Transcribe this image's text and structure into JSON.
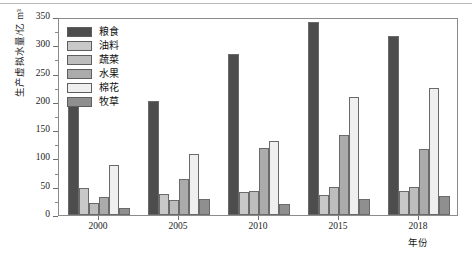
{
  "chart_data": {
    "type": "bar",
    "title": "",
    "xlabel": "年份",
    "ylabel": "生产虚拟水量/亿 m³",
    "categories": [
      "2000",
      "2005",
      "2010",
      "2015",
      "2018"
    ],
    "ylim": [
      0,
      350
    ],
    "yticks": [
      0,
      50,
      100,
      150,
      200,
      250,
      300,
      350
    ],
    "ytick_labels": [
      "0",
      "50",
      "100",
      "150",
      "200",
      "250",
      "300",
      "350"
    ],
    "minor_tick_step": 25,
    "grid": false,
    "legend_position": "upper-left-inside",
    "series": [
      {
        "name": "粮食",
        "color": "#4d4d4d",
        "values": [
          196,
          201,
          284,
          341,
          316
        ]
      },
      {
        "name": "油料",
        "color": "#c8c8c8",
        "values": [
          47,
          37,
          41,
          35,
          43
        ]
      },
      {
        "name": "蔬菜",
        "color": "#bdbdbd",
        "values": [
          22,
          27,
          42,
          49,
          49
        ]
      },
      {
        "name": "水果",
        "color": "#ababab",
        "values": [
          32,
          63,
          118,
          141,
          117
        ]
      },
      {
        "name": "棉花",
        "color": "#efefef",
        "values": [
          89,
          107,
          131,
          208,
          224
        ]
      },
      {
        "name": "牧草",
        "color": "#8f8f8f",
        "values": [
          12,
          29,
          20,
          28,
          34
        ]
      }
    ]
  }
}
